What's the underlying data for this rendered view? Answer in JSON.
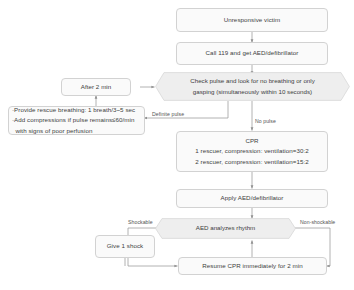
{
  "diagram": {
    "palette": {
      "node_fill": "#fafafa",
      "node_border": "#d2d2d2",
      "decision_fill": "#eeeeee",
      "decision_border": "#d8d8d8",
      "text": "#3d3d3d",
      "edge_label": "#555555",
      "connector": "#9a9a9a",
      "background": "#ffffff"
    },
    "nodes": {
      "unresponsive": {
        "type": "process",
        "label": "Unresponsive victim"
      },
      "call": {
        "type": "process",
        "label": "Call 119 and get AED/defibrillator"
      },
      "check": {
        "type": "decision",
        "line1": "Check pulse and look for no breathing or only",
        "line2": "gasping (simultaneously within 10 seconds)"
      },
      "after2min": {
        "type": "process",
        "label": "After 2 min"
      },
      "rescue": {
        "type": "process",
        "line1": "·Provide rescue breathing: 1 breath/3~5 sec",
        "line2": "·Add compressions if pulse remains≤60/min",
        "line3": "with signs of poor perfusion"
      },
      "cpr": {
        "type": "process",
        "line1": "CPR",
        "line2": "1 rescuer, compression: ventilation=30:2",
        "line3": "2 rescuer, compression: ventilation=15:2"
      },
      "apply_aed": {
        "type": "process",
        "label": "Apply AED/defibrillator"
      },
      "analyze": {
        "type": "decision",
        "label": "AED analyzes rhythm"
      },
      "shock": {
        "type": "process",
        "label": "Give 1 shock"
      },
      "resume": {
        "type": "process",
        "label": "Resume CPR immediately for 2 min"
      }
    },
    "edge_labels": {
      "definite_pulse": "Definite pulse",
      "no_pulse": "No pulse",
      "shockable": "Shockable",
      "non_shockable": "Non-shockable"
    }
  }
}
